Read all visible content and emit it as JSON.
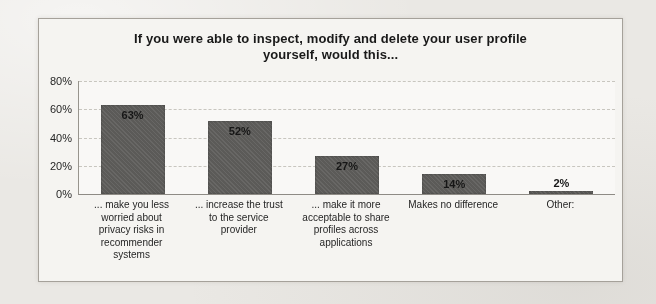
{
  "page": {
    "background": "#eae8e4",
    "frame_background": "#f7f6f3",
    "frame_border": "#a6a29b"
  },
  "chart_data": {
    "type": "bar",
    "title_line1": "If you were able to inspect, modify and delete your user profile",
    "title_line2": "yourself, would this...",
    "categories": [
      [
        "... make you less",
        "worried about",
        "privacy risks in",
        "recommender",
        "systems"
      ],
      [
        "... increase the trust",
        "to the service",
        "provider"
      ],
      [
        "... make it more",
        "acceptable to share",
        "profiles across",
        "applications"
      ],
      [
        "Makes no difference"
      ],
      [
        "Other:"
      ]
    ],
    "values": [
      63,
      52,
      27,
      14,
      2
    ],
    "value_labels": [
      "63%",
      "52%",
      "27%",
      "14%",
      "2%"
    ],
    "y_axis": {
      "ticks": [
        "80%",
        "60%",
        "40%",
        "20%",
        "0%"
      ],
      "max": 80,
      "step": 20,
      "unit": "%"
    },
    "ylim": [
      0,
      80
    ],
    "grid": true,
    "legend": "none",
    "bar_color": "#605f5c",
    "value_label_color": "#141414",
    "title_color": "#171717"
  }
}
